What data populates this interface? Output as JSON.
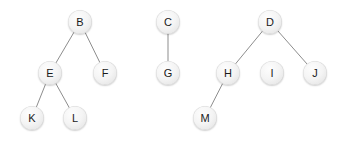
{
  "diagram": {
    "type": "node-link-forest",
    "canvas": {
      "width": 345,
      "height": 142,
      "background": "#ffffff"
    },
    "style": {
      "node_diameter": 24,
      "node_fill": "#f2f2f2",
      "node_stroke": "#d0d0d0",
      "label_color": "#1a1a1a",
      "edge_color": "#8d8d8d",
      "edge_width": 1
    },
    "nodes": [
      {
        "id": "B",
        "label": "B",
        "cx": 80,
        "cy": 22
      },
      {
        "id": "E",
        "label": "E",
        "cx": 50,
        "cy": 73
      },
      {
        "id": "F",
        "label": "F",
        "cx": 105,
        "cy": 73
      },
      {
        "id": "K",
        "label": "K",
        "cx": 32,
        "cy": 118
      },
      {
        "id": "L",
        "label": "L",
        "cx": 75,
        "cy": 118
      },
      {
        "id": "C",
        "label": "C",
        "cx": 168,
        "cy": 22
      },
      {
        "id": "G",
        "label": "G",
        "cx": 168,
        "cy": 73
      },
      {
        "id": "D",
        "label": "D",
        "cx": 270,
        "cy": 22
      },
      {
        "id": "H",
        "label": "H",
        "cx": 228,
        "cy": 73
      },
      {
        "id": "I",
        "label": "I",
        "cx": 272,
        "cy": 73
      },
      {
        "id": "J",
        "label": "J",
        "cx": 315,
        "cy": 73
      },
      {
        "id": "M",
        "label": "M",
        "cx": 205,
        "cy": 118
      }
    ],
    "edges": [
      {
        "from": "B",
        "to": "E"
      },
      {
        "from": "B",
        "to": "F"
      },
      {
        "from": "E",
        "to": "K"
      },
      {
        "from": "E",
        "to": "L"
      },
      {
        "from": "C",
        "to": "G"
      },
      {
        "from": "D",
        "to": "H"
      },
      {
        "from": "D",
        "to": "J"
      },
      {
        "from": "H",
        "to": "M"
      }
    ],
    "trees": [
      {
        "root": "B",
        "members": [
          "B",
          "E",
          "F",
          "K",
          "L"
        ]
      },
      {
        "root": "C",
        "members": [
          "C",
          "G"
        ]
      },
      {
        "root": "D",
        "members": [
          "D",
          "H",
          "I",
          "J",
          "M"
        ]
      }
    ]
  }
}
